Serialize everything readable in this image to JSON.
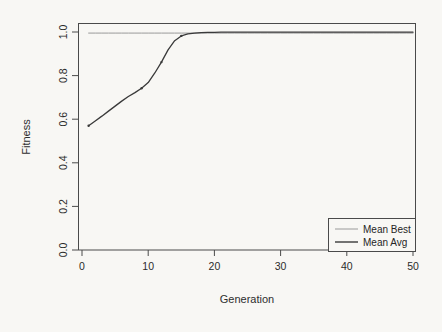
{
  "chart_data": {
    "type": "line",
    "title": "",
    "xlabel": "Generation",
    "ylabel": "Fitness",
    "xlim": [
      0,
      50
    ],
    "ylim": [
      0.0,
      1.0
    ],
    "xticks": [
      "0",
      "10",
      "20",
      "30",
      "40",
      "50"
    ],
    "xtick_values": [
      0,
      10,
      20,
      30,
      40,
      50
    ],
    "yticks": [
      "0.0",
      "0.2",
      "0.4",
      "0.6",
      "0.8",
      "1.0"
    ],
    "ytick_values": [
      0.0,
      0.2,
      0.4,
      0.6,
      0.8,
      1.0
    ],
    "grid": false,
    "legend_position": "bottom-right",
    "x": [
      1,
      2,
      3,
      4,
      5,
      6,
      7,
      8,
      9,
      10,
      11,
      12,
      13,
      14,
      15,
      16,
      17,
      18,
      19,
      20,
      21,
      22,
      23,
      24,
      25,
      26,
      27,
      28,
      29,
      30,
      31,
      32,
      33,
      34,
      35,
      36,
      37,
      38,
      39,
      40,
      41,
      42,
      43,
      44,
      45,
      46,
      47,
      48,
      49,
      50
    ],
    "series": [
      {
        "name": "Mean Best",
        "color": "#9a9a9a",
        "width": 1.0,
        "values": [
          0.995,
          0.995,
          0.995,
          0.995,
          0.995,
          0.995,
          0.995,
          0.995,
          0.995,
          0.995,
          0.995,
          0.995,
          0.995,
          0.995,
          0.995,
          0.995,
          0.995,
          0.995,
          0.995,
          0.995,
          0.995,
          0.995,
          0.995,
          0.995,
          0.995,
          0.995,
          0.995,
          0.995,
          0.995,
          0.995,
          0.995,
          0.995,
          0.995,
          0.995,
          0.995,
          0.995,
          0.995,
          0.995,
          0.995,
          0.995,
          0.995,
          0.995,
          0.995,
          0.995,
          0.995,
          0.995,
          0.995,
          0.995,
          0.995,
          0.995
        ]
      },
      {
        "name": "Mean Avg",
        "color": "#3a3a3a",
        "width": 1.3,
        "values": [
          0.57,
          0.592,
          0.614,
          0.637,
          0.66,
          0.683,
          0.704,
          0.722,
          0.742,
          0.768,
          0.812,
          0.862,
          0.918,
          0.96,
          0.982,
          0.991,
          0.995,
          0.997,
          0.998,
          0.998,
          0.999,
          0.999,
          0.999,
          0.999,
          0.999,
          0.999,
          0.999,
          0.999,
          0.999,
          0.999,
          0.999,
          0.999,
          0.999,
          0.999,
          0.999,
          0.999,
          0.999,
          0.999,
          0.999,
          0.999,
          0.999,
          0.999,
          0.999,
          0.999,
          0.999,
          0.999,
          0.999,
          0.999,
          0.999,
          0.999
        ]
      }
    ],
    "legend_entries": [
      {
        "label": "Mean Best",
        "color": "#9a9a9a"
      },
      {
        "label": "Mean Avg",
        "color": "#3a3a3a"
      }
    ]
  },
  "legend": {
    "entry_0_label": "Mean Best",
    "entry_1_label": "Mean Avg"
  },
  "axes": {
    "x_title": "Generation",
    "y_title": "Fitness",
    "x_tick_0": "0",
    "x_tick_1": "10",
    "x_tick_2": "20",
    "x_tick_3": "30",
    "x_tick_4": "40",
    "x_tick_5": "50",
    "y_tick_0": "0.0",
    "y_tick_1": "0.2",
    "y_tick_2": "0.4",
    "y_tick_3": "0.6",
    "y_tick_4": "0.8",
    "y_tick_5": "1.0"
  },
  "colors": {
    "background": "#f8f7f4",
    "frame": "#4a4a4a",
    "mean_best": "#9a9a9a",
    "mean_avg": "#3a3a3a",
    "text": "#2b2b2b"
  }
}
